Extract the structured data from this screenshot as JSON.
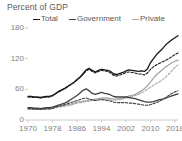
{
  "chart_data": {
    "type": "line",
    "title": "Percent of GDP",
    "xlabel": "",
    "ylabel": "Percent of GDP",
    "xlim": [
      1970,
      2019
    ],
    "ylim": [
      0,
      180
    ],
    "yticks": [
      0,
      60,
      120,
      180
    ],
    "xticks": [
      1970,
      1978,
      1986,
      1994,
      2002,
      2010,
      2018
    ],
    "grid": false,
    "legend_position": "top",
    "colors": {
      "total": "#1a1a1a",
      "government": "#404040",
      "private": "#a6a6a6",
      "axis": "#bfbfbf",
      "text": "#595959",
      "tick_text": "#7f7f7f",
      "background": "#ffffff"
    },
    "legend": [
      {
        "label": "Total",
        "color": "#1a1a1a"
      },
      {
        "label": "Government",
        "color": "#404040"
      },
      {
        "label": "Private",
        "color": "#a6a6a6"
      }
    ],
    "x": [
      1970,
      1971,
      1972,
      1973,
      1974,
      1975,
      1976,
      1977,
      1978,
      1979,
      1980,
      1981,
      1982,
      1983,
      1984,
      1985,
      1986,
      1987,
      1988,
      1989,
      1990,
      1991,
      1992,
      1993,
      1994,
      1995,
      1996,
      1997,
      1998,
      1999,
      2000,
      2001,
      2002,
      2003,
      2004,
      2005,
      2006,
      2007,
      2008,
      2009,
      2010,
      2011,
      2012,
      2013,
      2014,
      2015,
      2016,
      2017,
      2018,
      2019
    ],
    "series": [
      {
        "name": "Total",
        "style": "solid",
        "color": "#1a1a1a",
        "values": [
          46,
          46,
          45,
          45,
          44,
          45,
          46,
          46,
          48,
          52,
          56,
          59,
          62,
          66,
          70,
          74,
          79,
          84,
          91,
          98,
          101,
          97,
          94,
          97,
          99,
          98,
          97,
          95,
          90,
          89,
          91,
          93,
          96,
          98,
          97,
          96,
          95,
          96,
          95,
          100,
          112,
          120,
          128,
          134,
          140,
          147,
          152,
          157,
          161,
          165
        ]
      },
      {
        "name": "Total (alt)",
        "style": "dashed",
        "color": "#1a1a1a",
        "values": [
          45,
          45,
          44,
          44,
          43,
          44,
          45,
          45,
          47,
          51,
          55,
          58,
          61,
          65,
          69,
          73,
          78,
          83,
          89,
          96,
          99,
          95,
          92,
          95,
          97,
          96,
          95,
          92,
          87,
          86,
          88,
          90,
          93,
          94,
          93,
          92,
          90,
          90,
          88,
          92,
          99,
          104,
          108,
          111,
          114,
          117,
          120,
          124,
          128,
          131
        ]
      },
      {
        "name": "Government",
        "style": "solid",
        "color": "#404040",
        "values": [
          24,
          24,
          23,
          23,
          22,
          23,
          24,
          24,
          25,
          27,
          29,
          31,
          33,
          36,
          40,
          44,
          48,
          53,
          58,
          61,
          57,
          52,
          50,
          52,
          54,
          52,
          51,
          49,
          46,
          45,
          45,
          45,
          45,
          44,
          43,
          42,
          40,
          38,
          36,
          35,
          35,
          36,
          38,
          40,
          41,
          43,
          45,
          47,
          49,
          51
        ]
      },
      {
        "name": "Government (alt)",
        "style": "dashed",
        "color": "#404040",
        "values": [
          22,
          22,
          21,
          21,
          21,
          21,
          22,
          22,
          23,
          25,
          27,
          28,
          30,
          32,
          34,
          36,
          38,
          40,
          42,
          43,
          41,
          39,
          38,
          39,
          40,
          39,
          38,
          37,
          35,
          34,
          34,
          34,
          34,
          33,
          33,
          32,
          31,
          30,
          29,
          29,
          30,
          32,
          34,
          37,
          40,
          44,
          48,
          52,
          55,
          57
        ]
      },
      {
        "name": "Private",
        "style": "solid",
        "color": "#a6a6a6",
        "values": [
          22,
          22,
          22,
          22,
          22,
          22,
          22,
          22,
          23,
          25,
          27,
          28,
          29,
          30,
          31,
          33,
          35,
          36,
          37,
          38,
          39,
          40,
          41,
          42,
          43,
          43,
          43,
          42,
          41,
          41,
          42,
          43,
          45,
          47,
          48,
          50,
          53,
          57,
          61,
          67,
          74,
          82,
          89,
          94,
          99,
          104,
          108,
          112,
          115,
          117
        ]
      },
      {
        "name": "Private (alt)",
        "style": "dashed",
        "color": "#a6a6a6",
        "values": [
          21,
          21,
          21,
          21,
          21,
          21,
          21,
          21,
          22,
          24,
          25,
          26,
          27,
          28,
          29,
          31,
          33,
          34,
          35,
          36,
          37,
          38,
          39,
          40,
          40,
          40,
          40,
          39,
          39,
          39,
          40,
          41,
          43,
          44,
          46,
          48,
          50,
          53,
          56,
          60,
          64,
          68,
          72,
          75,
          79,
          84,
          90,
          96,
          103,
          108
        ]
      }
    ]
  }
}
